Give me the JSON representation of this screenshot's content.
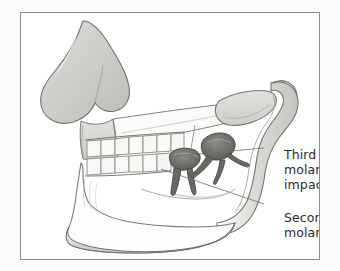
{
  "figure": {
    "type": "medical-illustration",
    "style": "grayscale pencil line drawing",
    "frame_border_color": "#8a8d90",
    "background_color": "#ffffff",
    "page_background_color": "#f4f4f4",
    "ink_color": "#6d6f72",
    "bone_fill_color": "#fdfdfc",
    "shading_color": "#d4d2cf",
    "tooth_fill_color": "#f7f7f5",
    "highlight_tooth_color": "#6b6a67"
  },
  "labels": {
    "third_molar": {
      "lines": [
        "Third",
        "molar",
        "impacted"
      ],
      "line1": "Third",
      "line2": "molar",
      "line3": "impacted",
      "text_color": "#2b2b2b"
    },
    "second_molar": {
      "lines": [
        "Second",
        "molar"
      ],
      "line1": "Second",
      "line2": "molar",
      "text_color": "#2b2b2b"
    }
  },
  "anatomy": {
    "parts": [
      "nasal bone",
      "maxilla",
      "upper tooth row",
      "lower tooth row",
      "mandible body",
      "mandibular ramus",
      "coronoid process",
      "condyle",
      "second molar",
      "impacted third molar"
    ],
    "upper_teeth_count": 7,
    "lower_teeth_count": 7
  },
  "leader_lines": {
    "third_molar": {
      "from_x": 175,
      "from_y": 155,
      "to_x": 260,
      "to_y": 147
    },
    "second_molar": {
      "from_x": 160,
      "from_y": 168,
      "to_x": 260,
      "to_y": 203
    }
  }
}
